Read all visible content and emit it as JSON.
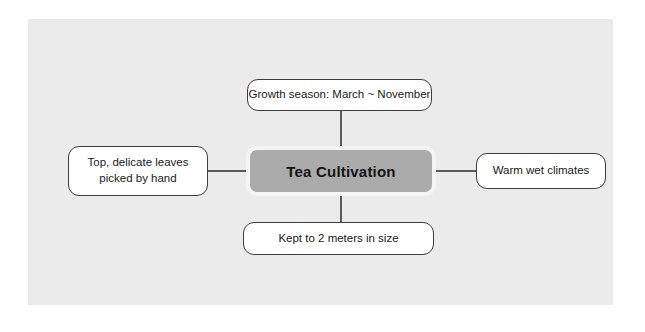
{
  "diagram": {
    "type": "mind-map",
    "background_color": "#ebebeb",
    "page_color": "#ffffff",
    "center": {
      "label": "Tea Cultivation",
      "fill_color": "#ababab",
      "text_color": "#141414"
    },
    "branches": [
      {
        "id": "top",
        "position": "top",
        "label": "Growth season: March ~ November",
        "fill_color": "#ffffff",
        "border_color": "#3d3d3d"
      },
      {
        "id": "left",
        "position": "left",
        "label": "Top, delicate leaves\npicked by hand",
        "line1": "Top, delicate leaves",
        "line2": "picked by hand",
        "fill_color": "#ffffff",
        "border_color": "#3d3d3d"
      },
      {
        "id": "right",
        "position": "right",
        "label": "Warm wet climates",
        "fill_color": "#ffffff",
        "border_color": "#3d3d3d"
      },
      {
        "id": "bottom",
        "position": "bottom",
        "label": "Kept to 2 meters in size",
        "fill_color": "#ffffff",
        "border_color": "#3d3d3d"
      }
    ],
    "connector_color": "#5a5a5a"
  }
}
